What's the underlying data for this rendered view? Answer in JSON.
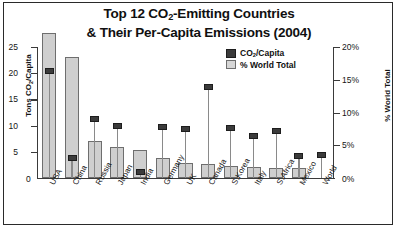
{
  "chart_data": {
    "type": "bar",
    "title_line1": "Top 12 CO2-Emitting Countries",
    "title_line2": "& Their Per-Capita Emissions (2004)",
    "title_l1_pre": "Top 12 CO",
    "title_l1_sub": "2",
    "title_l1_post": "-Emitting Countries",
    "categories": [
      "USA",
      "China",
      "Russia",
      "Japan",
      "India",
      "Germany",
      "UK",
      "Canada",
      "S.Korea",
      "Italy",
      "S.Africa",
      "Mexico",
      "World"
    ],
    "ylabel_left_pre": "Tons CO",
    "ylabel_left_sub": "2",
    "ylabel_left_post": "/Capita",
    "ylabel_right": "% World Total",
    "ylim_left": [
      0,
      25
    ],
    "ylim_right": [
      0,
      20
    ],
    "yticks_left": [
      "25",
      "20",
      "15",
      "10",
      "5"
    ],
    "ytick_left_zero": "0",
    "yticks_right": [
      "20%",
      "15%",
      "10%",
      "5%"
    ],
    "ytick_right_zero": "0%",
    "grid": false,
    "legend_position": "upper-right",
    "series": [
      {
        "name": "% World Total",
        "axis": "right",
        "unit": "%",
        "values": [
          22.2,
          18.4,
          5.7,
          4.8,
          4.3,
          3.0,
          2.3,
          2.2,
          1.8,
          1.7,
          1.5,
          1.5,
          null
        ]
      },
      {
        "name": "CO2/Capita",
        "axis": "left",
        "unit": "tons",
        "values": [
          20.4,
          3.8,
          11.2,
          9.9,
          1.2,
          9.8,
          9.4,
          17.4,
          9.6,
          8.0,
          9.0,
          4.2,
          4.4
        ]
      }
    ],
    "legend": [
      {
        "label_pre": "CO",
        "label_sub": "2",
        "label_post": "/Capita",
        "swatch": "dark",
        "color": "#3b3b3b"
      },
      {
        "label_pre": "% World Total",
        "label_sub": "",
        "label_post": "",
        "swatch": "light",
        "color": "#d6d6d6"
      }
    ]
  }
}
